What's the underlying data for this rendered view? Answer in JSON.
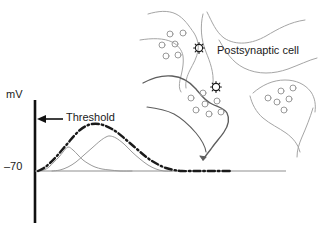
{
  "figure": {
    "background_color": "#ffffff"
  },
  "axes": {
    "y_axis_label": "mV",
    "baseline_tick_label": "–70",
    "axis_color": "#111111",
    "baseline_color": "#8f8f8f",
    "y_axis_top_px": 100,
    "y_axis_bottom_px": 223,
    "y_axis_x_px": 35,
    "baseline_y_px": 171,
    "baseline_end_x_px": 286
  },
  "annotations": {
    "threshold_label": "Threshold",
    "threshold_arrow_color": "#111111",
    "threshold_arrow_y_px": 119,
    "threshold_arrow_from_x_px": 63,
    "threshold_arrow_to_x_px": 37,
    "postsynaptic_cell_label": "Postsynaptic cell"
  },
  "chart_data": {
    "type": "line",
    "xlabel": "",
    "ylabel": "mV",
    "ytick_labels": [
      "–70"
    ],
    "grid": false,
    "legend_position": "none",
    "axis_ranges": {
      "x": [
        35,
        286
      ],
      "y": [
        -70,
        -40
      ]
    },
    "series": [
      {
        "name": "EPSP 1 (single, subthreshold)",
        "style": "thin-solid",
        "color": "#9a9a9a",
        "width": 1,
        "peak_x_px": 68,
        "peak_y_px": 147,
        "points": [
          [
            38,
            171
          ],
          [
            44,
            170
          ],
          [
            49,
            167
          ],
          [
            54,
            162
          ],
          [
            59,
            157
          ],
          [
            63,
            152
          ],
          [
            68,
            147
          ],
          [
            73,
            150
          ],
          [
            78,
            155
          ],
          [
            83,
            160
          ],
          [
            89,
            164
          ],
          [
            95,
            167
          ],
          [
            102,
            169
          ],
          [
            110,
            170
          ],
          [
            120,
            171
          ],
          [
            132,
            171
          ]
        ]
      },
      {
        "name": "EPSP 2 (single, subthreshold)",
        "style": "thin-solid",
        "color": "#9a9a9a",
        "width": 1,
        "peak_x_px": 110,
        "peak_y_px": 136,
        "points": [
          [
            52,
            171
          ],
          [
            60,
            170
          ],
          [
            68,
            167
          ],
          [
            76,
            162
          ],
          [
            84,
            155
          ],
          [
            92,
            148
          ],
          [
            100,
            141
          ],
          [
            106,
            137
          ],
          [
            110,
            136
          ],
          [
            116,
            138
          ],
          [
            124,
            144
          ],
          [
            132,
            152
          ],
          [
            140,
            159
          ],
          [
            148,
            165
          ],
          [
            156,
            169
          ],
          [
            164,
            171
          ],
          [
            172,
            171
          ]
        ]
      },
      {
        "name": "Summed potential (suprathreshold, dashed)",
        "style": "bold-dash-dot",
        "color": "#1a1a1a",
        "width": 2.4,
        "peak_x_px": 92,
        "peak_y_px": 124,
        "points": [
          [
            38,
            171
          ],
          [
            44,
            168
          ],
          [
            50,
            163
          ],
          [
            56,
            157
          ],
          [
            62,
            150
          ],
          [
            68,
            143
          ],
          [
            74,
            136
          ],
          [
            80,
            130
          ],
          [
            86,
            126
          ],
          [
            92,
            124
          ],
          [
            99,
            124
          ],
          [
            106,
            126
          ],
          [
            112,
            129
          ],
          [
            118,
            133
          ],
          [
            124,
            138
          ],
          [
            131,
            144
          ],
          [
            138,
            150
          ],
          [
            145,
            156
          ],
          [
            152,
            161
          ],
          [
            159,
            165
          ],
          [
            166,
            168
          ],
          [
            174,
            170
          ],
          [
            182,
            171
          ],
          [
            196,
            171
          ],
          [
            212,
            171
          ],
          [
            230,
            171
          ]
        ]
      }
    ]
  },
  "cell_diagram": {
    "name": "postsynaptic-cell-diagram",
    "outline_color": "#9a9a9a",
    "dark_outline_color": "#5a5a5a",
    "vesicle_color": "#9a9a9a",
    "synapse_marker_color": "#1a1a1a",
    "terminals": [
      {
        "id": "terminal-upper",
        "vesicle_count": 6,
        "has_synapse_marker": true
      },
      {
        "id": "terminal-middle",
        "vesicle_count": 6,
        "has_synapse_marker": true
      },
      {
        "id": "terminal-right",
        "vesicle_count": 6,
        "has_synapse_marker": false
      }
    ]
  }
}
